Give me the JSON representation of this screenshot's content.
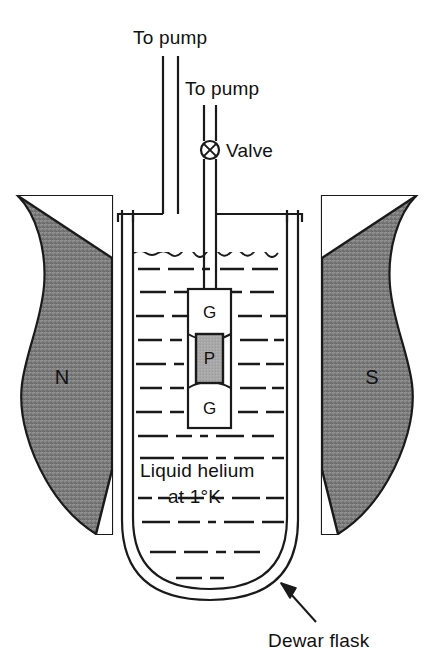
{
  "figure": {
    "background_color": "#ffffff",
    "line_color": "#1a1a1a"
  },
  "labels": {
    "to_pump_outer": "To pump",
    "to_pump_inner": "To pump",
    "valve": "Valve",
    "pole_north": "N",
    "pole_south": "S",
    "liquid_line1": "Liquid  helium",
    "liquid_line2": "at 1°K",
    "dewar_flask": "Dewar flask",
    "sample_top": "G",
    "sample_middle": "P",
    "sample_bottom": "G"
  },
  "icons": {
    "valve": "valve-cross-circle-icon",
    "arrow": "pointer-arrow-icon",
    "liquid_surface": "wavy-liquid-surface-icon",
    "hatch": "dash-dot-liquid-hatch-icon"
  },
  "colors": {
    "pole_fill": "#808080",
    "pole_stroke": "#1a1a1a",
    "sample_p_fill": "#a8a8a8",
    "sample_g_fill": "#ffffff",
    "outline": "#1a1a1a",
    "background": "#ffffff"
  },
  "geometry": {
    "width": 434,
    "height": 666,
    "dewar_outer_left": 122,
    "dewar_inner_left": 133,
    "dewar_inner_right": 287,
    "dewar_outer_right": 298,
    "dewar_top": 213,
    "dewar_bottom": 600,
    "liquid_surface_y": 252,
    "outer_tube_left": 163,
    "outer_tube_right": 178,
    "inner_tube_left": 203,
    "inner_tube_right": 216,
    "valve_center_x": 210,
    "valve_center_y": 150,
    "valve_radius": 9,
    "sample_box_left": 188,
    "sample_box_right": 231,
    "sample_box_top": 289,
    "sample_box_bottom": 428
  }
}
